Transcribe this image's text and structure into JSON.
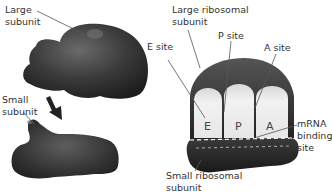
{
  "left_panel": {
    "large_subunit_label_1": "Large",
    "large_subunit_label_2": "subunit",
    "small_subunit_label_1": "Small",
    "small_subunit_label_2": "subunit"
  },
  "right_panel": {
    "large_ribosomal_label_1": "Large ribosomal",
    "large_ribosomal_label_2": "subunit",
    "e_site_label": "E site",
    "p_site_label": "P site",
    "a_site_label": "A site",
    "e_letter": "E",
    "p_letter": "P",
    "a_letter": "A",
    "mrna_label_1": "mRNA",
    "mrna_label_2": "binding",
    "mrna_label_3": "site",
    "small_ribosomal_label_1": "Small ribosomal",
    "small_ribosomal_label_2": "subunit"
  },
  "colors": {
    "subunit_dark": "#2e2e2e",
    "subunit_mid": "#4a4a4a",
    "site_fill": "#e9e9e9",
    "label_text": "#333333",
    "leader_line": "#555555"
  }
}
